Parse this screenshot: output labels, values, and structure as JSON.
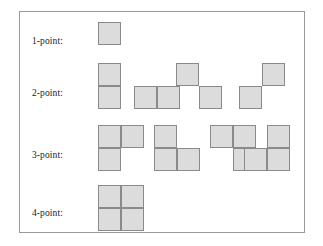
{
  "figure": {
    "frame": {
      "border_color": "#9a9a9a",
      "background_color": "#ffffff"
    },
    "cell": {
      "size_px": 23,
      "fill_color": "#dcdcdc",
      "border_color": "#8a8a8a"
    },
    "rows": [
      {
        "label": "1-point:",
        "label_top": 24,
        "shapes": [
          {
            "name": "single-cell",
            "left": 78,
            "top": 10,
            "cells": [
              [
                0,
                0
              ]
            ]
          }
        ]
      },
      {
        "label": "2-point:",
        "label_top": 76,
        "shapes": [
          {
            "name": "vertical-domino",
            "left": 78,
            "top": 51,
            "cells": [
              [
                0,
                0
              ],
              [
                0,
                1
              ]
            ]
          },
          {
            "name": "horizontal-domino",
            "left": 114,
            "top": 74,
            "cells": [
              [
                0,
                0
              ],
              [
                1,
                0
              ]
            ]
          },
          {
            "name": "diagonal-down-pair",
            "left": 156,
            "top": 51,
            "cells": [
              [
                0,
                0
              ],
              [
                1,
                1
              ]
            ]
          },
          {
            "name": "diagonal-up-pair",
            "left": 219,
            "top": 51,
            "cells": [
              [
                1,
                0
              ],
              [
                0,
                1
              ]
            ]
          }
        ]
      },
      {
        "label": "3-point:",
        "label_top": 138,
        "shapes": [
          {
            "name": "l-tromino-a",
            "left": 78,
            "top": 113,
            "cells": [
              [
                0,
                0
              ],
              [
                1,
                0
              ],
              [
                0,
                1
              ]
            ]
          },
          {
            "name": "l-tromino-b",
            "left": 134,
            "top": 113,
            "cells": [
              [
                0,
                0
              ],
              [
                0,
                1
              ],
              [
                1,
                1
              ]
            ]
          },
          {
            "name": "l-tromino-c",
            "left": 190,
            "top": 113,
            "cells": [
              [
                0,
                0
              ],
              [
                1,
                0
              ],
              [
                1,
                1
              ]
            ]
          },
          {
            "name": "l-tromino-d",
            "left": 224,
            "top": 113,
            "cells": [
              [
                1,
                0
              ],
              [
                0,
                1
              ],
              [
                1,
                1
              ]
            ]
          }
        ]
      },
      {
        "label": "4-point:",
        "label_top": 196,
        "shapes": [
          {
            "name": "square-tetromino",
            "left": 78,
            "top": 173,
            "cells": [
              [
                0,
                0
              ],
              [
                1,
                0
              ],
              [
                0,
                1
              ],
              [
                1,
                1
              ]
            ]
          }
        ]
      }
    ]
  }
}
